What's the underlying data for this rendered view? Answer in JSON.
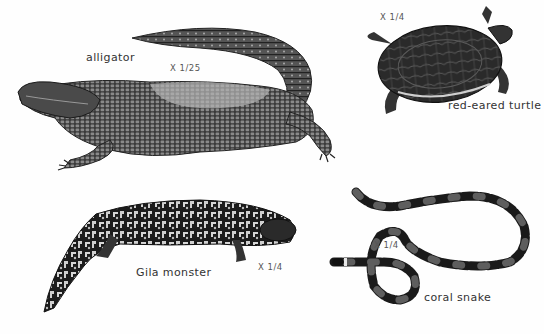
{
  "plate": {
    "background": "#fefefe",
    "ink_color": "#1e1e1e",
    "animals": [
      {
        "id": "alligator",
        "name": "alligator",
        "scale": "X 1/25"
      },
      {
        "id": "turtle",
        "name": "red-eared turtle",
        "scale": "X 1/4"
      },
      {
        "id": "gila",
        "name": "Gila monster",
        "scale": "X 1/4"
      },
      {
        "id": "snake",
        "name": "coral snake",
        "scale": "X 1/4"
      }
    ]
  }
}
